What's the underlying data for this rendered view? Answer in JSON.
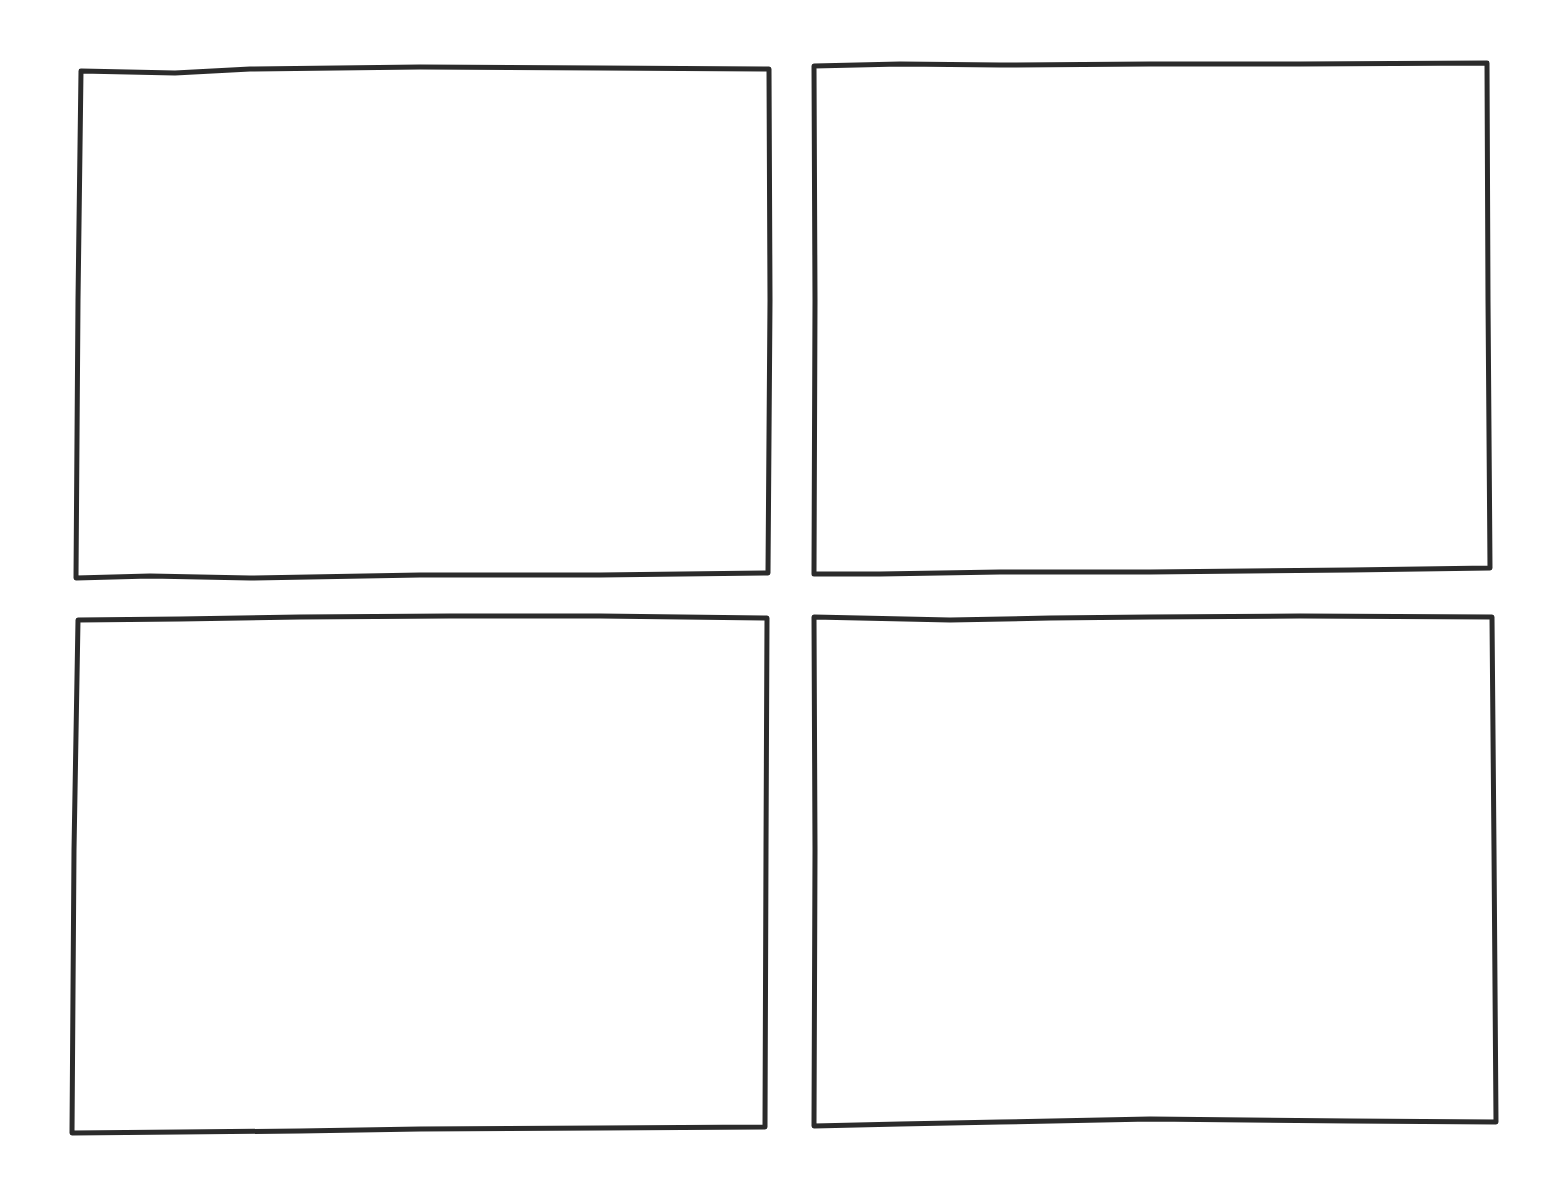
{
  "sheet": {
    "width": 1565,
    "height": 1184,
    "background": "#ffffff",
    "stroke_color": "#2b2b2b",
    "stroke_width": 5
  },
  "panels": [
    {
      "id": "panel-top-left",
      "row": 1,
      "col": 1,
      "content": "",
      "points": [
        [
          81,
          71
        ],
        [
          175,
          73
        ],
        [
          250,
          69
        ],
        [
          420,
          67
        ],
        [
          600,
          68
        ],
        [
          769,
          69
        ],
        [
          770,
          300
        ],
        [
          768,
          573
        ],
        [
          600,
          575
        ],
        [
          420,
          575
        ],
        [
          250,
          578
        ],
        [
          150,
          576
        ],
        [
          76,
          578
        ],
        [
          78,
          300
        ]
      ]
    },
    {
      "id": "panel-top-right",
      "row": 1,
      "col": 2,
      "content": "",
      "points": [
        [
          814,
          66
        ],
        [
          900,
          64
        ],
        [
          1000,
          65
        ],
        [
          1150,
          64
        ],
        [
          1300,
          64
        ],
        [
          1487,
          63
        ],
        [
          1488,
          300
        ],
        [
          1490,
          568
        ],
        [
          1350,
          570
        ],
        [
          1150,
          572
        ],
        [
          1000,
          572
        ],
        [
          880,
          574
        ],
        [
          814,
          574
        ],
        [
          815,
          300
        ]
      ]
    },
    {
      "id": "panel-bottom-left",
      "row": 2,
      "col": 1,
      "content": "",
      "points": [
        [
          78,
          620
        ],
        [
          180,
          619
        ],
        [
          300,
          617
        ],
        [
          450,
          616
        ],
        [
          600,
          616
        ],
        [
          767,
          618
        ],
        [
          766,
          850
        ],
        [
          765,
          1127
        ],
        [
          600,
          1128
        ],
        [
          420,
          1129
        ],
        [
          300,
          1131
        ],
        [
          180,
          1132
        ],
        [
          72,
          1133
        ],
        [
          74,
          850
        ]
      ]
    },
    {
      "id": "panel-bottom-right",
      "row": 2,
      "col": 2,
      "content": "",
      "points": [
        [
          814,
          617
        ],
        [
          950,
          620
        ],
        [
          1050,
          618
        ],
        [
          1150,
          617
        ],
        [
          1300,
          616
        ],
        [
          1492,
          617
        ],
        [
          1494,
          850
        ],
        [
          1496,
          1122
        ],
        [
          1350,
          1121
        ],
        [
          1150,
          1119
        ],
        [
          1000,
          1122
        ],
        [
          900,
          1124
        ],
        [
          814,
          1126
        ],
        [
          815,
          850
        ]
      ]
    }
  ]
}
